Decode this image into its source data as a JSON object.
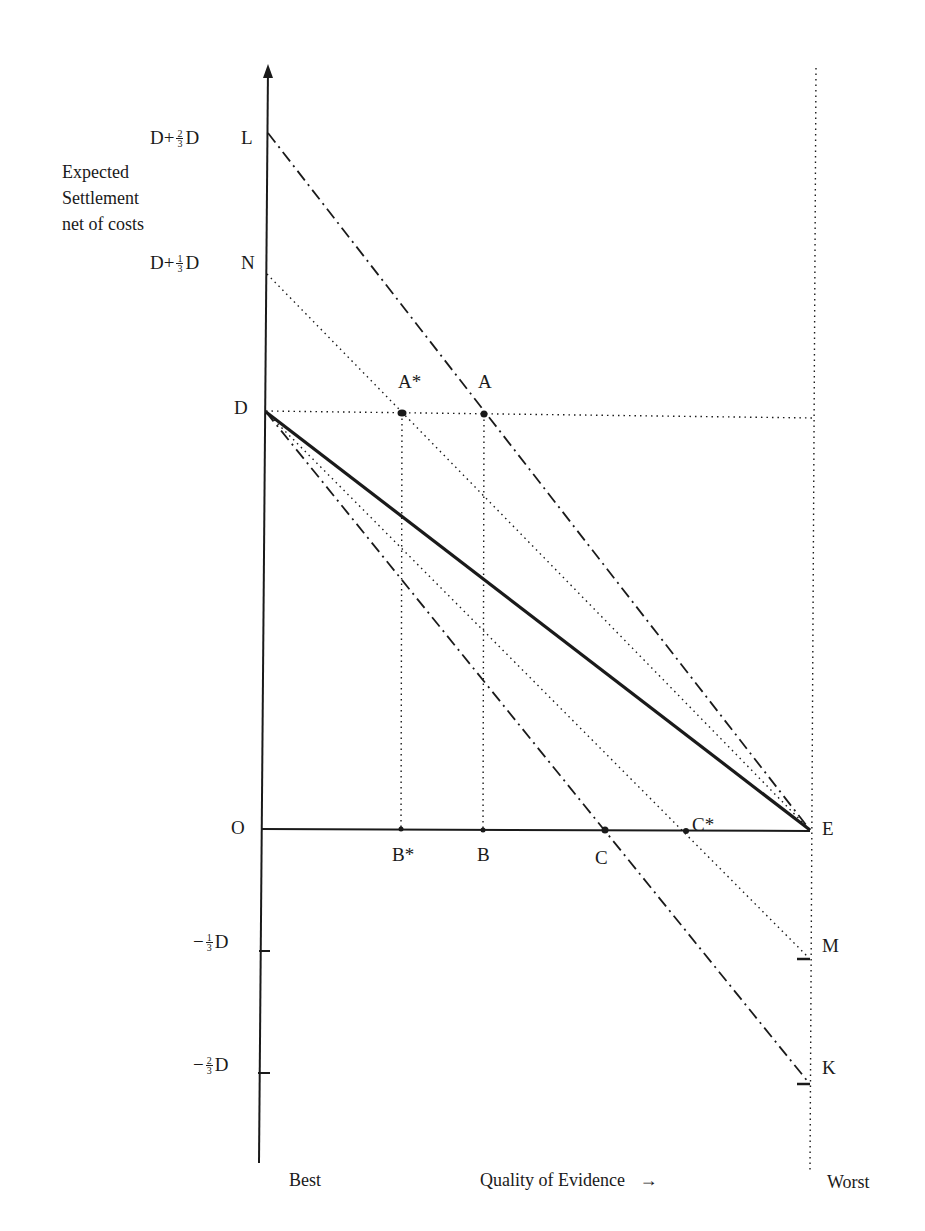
{
  "header": {
    "faint_text": ""
  },
  "axes": {
    "ylabel_lines": [
      "Expected",
      "Settlement",
      "net of costs"
    ],
    "x_left": "Best",
    "x_title": "Quality of Evidence",
    "x_arrow": "→",
    "x_right": "Worst"
  },
  "ticks": {
    "L": {
      "prefix": "D+",
      "num": "2",
      "den": "3",
      "suffix": "D",
      "point": "L"
    },
    "N": {
      "prefix": "D+",
      "num": "1",
      "den": "3",
      "suffix": "D",
      "point": "N"
    },
    "D": {
      "label": "D"
    },
    "O": {
      "label": "O"
    },
    "neg1": {
      "prefix": "−",
      "num": "1",
      "den": "3",
      "suffix": "D"
    },
    "neg2": {
      "prefix": "−",
      "num": "2",
      "den": "3",
      "suffix": "D"
    }
  },
  "points": {
    "A_star": "A*",
    "A": "A",
    "B_star": "B*",
    "B": "B",
    "C": "C",
    "C_star": "C*",
    "E": "E",
    "M": "M",
    "K": "K"
  },
  "lines": [
    {
      "name": "L-E",
      "from": "L",
      "to": "E",
      "style": "dash-dot"
    },
    {
      "name": "N-E",
      "from": "N",
      "to": "E",
      "style": "dotted"
    },
    {
      "name": "D-E",
      "from": "D",
      "to": "E",
      "style": "solid-thick"
    },
    {
      "name": "D-M",
      "from": "D",
      "to": "M",
      "style": "dotted"
    },
    {
      "name": "D-K",
      "from": "D",
      "to": "K",
      "style": "dash-dot"
    },
    {
      "name": "D-horizontal",
      "from": "D",
      "to": "right-edge",
      "style": "dotted"
    },
    {
      "name": "A*-B*",
      "from": "A*",
      "to": "B*",
      "style": "dotted"
    },
    {
      "name": "A-B",
      "from": "A",
      "to": "B",
      "style": "dotted"
    },
    {
      "name": "worst-vertical",
      "style": "dotted"
    }
  ],
  "colors": {
    "ink": "#1a1a1a",
    "background": "#ffffff"
  }
}
